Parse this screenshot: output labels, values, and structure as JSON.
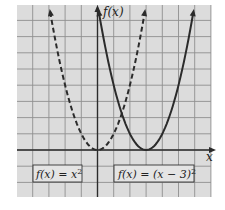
{
  "chart_data": {
    "type": "line",
    "title": "",
    "xlabel": "x",
    "ylabel": "f(x)",
    "xlim": [
      -5,
      7
    ],
    "ylim": [
      -3,
      9
    ],
    "grid": true,
    "tick_labels_shown": false,
    "series": [
      {
        "name": "f(x) = x^2",
        "label": "f(x) = x²",
        "style": "dashed",
        "color": "#2b2b2b",
        "formula": "x^2",
        "vertex": [
          0,
          0
        ],
        "x": [
          -3,
          -2,
          -1,
          0,
          1,
          2,
          3
        ],
        "y": [
          9,
          4,
          1,
          0,
          1,
          4,
          9
        ]
      },
      {
        "name": "f(x) = (x - 3)^2",
        "label": "f(x) = (x − 3)²",
        "style": "solid",
        "color": "#2b2b2b",
        "formula": "(x-3)^2",
        "vertex": [
          3,
          0
        ],
        "x": [
          0,
          1,
          2,
          3,
          4,
          5,
          6
        ],
        "y": [
          9,
          4,
          1,
          0,
          1,
          4,
          9
        ]
      }
    ],
    "intersection": [
      1.5,
      2.25
    ]
  },
  "axes": {
    "x_label": "x",
    "y_label": "f(x)"
  },
  "legend": {
    "left_box": "f(x) = x",
    "left_sup": "2",
    "right_box": "f(x) = (x − 3)",
    "right_sup": "2"
  },
  "colors": {
    "grid_bg": "#dcdcdc",
    "grid_line": "#8f8f8f",
    "axis": "#2b2b2b",
    "curve": "#2b2b2b",
    "label_box_bg": "#e4e4e4"
  }
}
